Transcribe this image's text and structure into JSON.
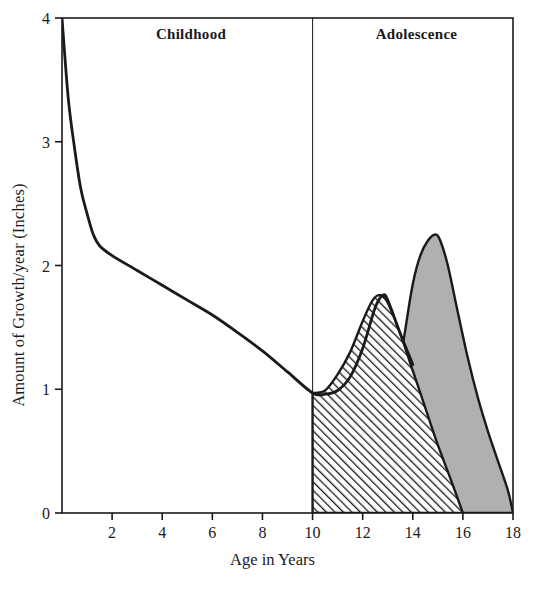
{
  "chart_data": {
    "type": "area",
    "title": "",
    "xlabel": "Age in Years",
    "ylabel": "Amount of Growth/year (Inches)",
    "xlim": [
      0,
      18
    ],
    "ylim": [
      0,
      4
    ],
    "xticks": [
      2,
      4,
      6,
      8,
      10,
      12,
      14,
      16,
      18
    ],
    "yticks": [
      0,
      1,
      2,
      3,
      4
    ],
    "grid": false,
    "legend_position": "none",
    "annotations": [
      {
        "text": "Childhood",
        "x_range": [
          0,
          10
        ]
      },
      {
        "text": "Adolescence",
        "x_range": [
          10,
          18
        ]
      }
    ],
    "divider_x": 10,
    "series": [
      {
        "name": "General growth curve",
        "type": "line",
        "style": "solid-black-line",
        "x": [
          0,
          0.25,
          0.5,
          0.75,
          1,
          1.25,
          1.5,
          2,
          3,
          4,
          5,
          6,
          7,
          8,
          9,
          10,
          10.5,
          11,
          11.5,
          12,
          12.5,
          12.8,
          13,
          13.5,
          14
        ],
        "y": [
          4.0,
          3.35,
          2.95,
          2.62,
          2.42,
          2.25,
          2.16,
          2.08,
          1.96,
          1.84,
          1.72,
          1.6,
          1.46,
          1.31,
          1.14,
          0.97,
          0.96,
          0.99,
          1.1,
          1.33,
          1.66,
          1.76,
          1.72,
          1.45,
          1.2
        ]
      },
      {
        "name": "Female adolescent growth spurt",
        "type": "area",
        "style": "diagonal-hatch",
        "x": [
          10,
          10.5,
          11,
          11.5,
          12,
          12.4,
          12.7,
          13,
          13.5,
          14,
          14.5,
          15,
          15.5,
          16
        ],
        "y": [
          0.97,
          0.99,
          1.12,
          1.3,
          1.55,
          1.72,
          1.76,
          1.7,
          1.45,
          1.15,
          0.85,
          0.55,
          0.28,
          0.0
        ],
        "peak": {
          "x": 12.7,
          "y": 1.76
        }
      },
      {
        "name": "Male adolescent growth spurt",
        "type": "area",
        "style": "gray-fill",
        "fill_color": "#b0b0b0",
        "x": [
          12.8,
          13,
          13.3,
          13.7,
          14,
          14.3,
          14.6,
          14.9,
          15.1,
          15.4,
          15.8,
          16.2,
          16.6,
          17,
          17.4,
          17.8,
          18
        ],
        "y": [
          0.0,
          0.45,
          0.95,
          1.48,
          1.85,
          2.08,
          2.2,
          2.25,
          2.2,
          2.0,
          1.62,
          1.25,
          0.93,
          0.66,
          0.42,
          0.18,
          0.0
        ],
        "peak": {
          "x": 14.9,
          "y": 2.25
        }
      }
    ]
  },
  "axis": {
    "y_tick_labels": [
      "0",
      "1",
      "2",
      "3",
      "4"
    ],
    "x_tick_labels": [
      "2",
      "4",
      "6",
      "8",
      "10",
      "12",
      "14",
      "16",
      "18"
    ],
    "y_title": "Amount of Growth/year (Inches)",
    "x_title": "Age in Years"
  },
  "phases": {
    "childhood": "Childhood",
    "adolescence": "Adolescence"
  },
  "colors": {
    "line": "#1a1a1a",
    "gray_fill": "#b0b0b0",
    "hatch": "#1a1a1a",
    "background": "#ffffff"
  }
}
